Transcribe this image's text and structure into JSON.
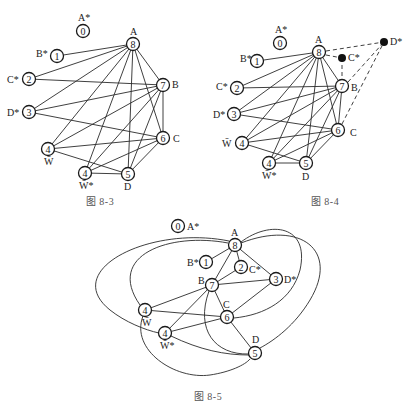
{
  "top_cutoff_text": "",
  "figures": [
    {
      "id": "fig-8-3",
      "caption": "图 8-3",
      "nodes": [
        {
          "key": "A*",
          "value": "0",
          "label": "A*",
          "x": 83,
          "y": 31
        },
        {
          "key": "B*",
          "value": "1",
          "label": "B*",
          "x": 57,
          "y": 56
        },
        {
          "key": "C*",
          "value": "2",
          "label": "C*",
          "x": 29,
          "y": 79
        },
        {
          "key": "D*",
          "value": "3",
          "label": "D*",
          "x": 29,
          "y": 112
        },
        {
          "key": "A",
          "value": "8",
          "label": "A",
          "x": 133,
          "y": 44
        },
        {
          "key": "B",
          "value": "7",
          "label": "B",
          "x": 163,
          "y": 85
        },
        {
          "key": "C",
          "value": "6",
          "label": "C",
          "x": 163,
          "y": 138
        },
        {
          "key": "W",
          "value": "4",
          "label": "W̄",
          "x": 48,
          "y": 149
        },
        {
          "key": "W*",
          "value": "4",
          "label": "W̄*",
          "x": 85,
          "y": 173
        },
        {
          "key": "D",
          "value": "5",
          "label": "D",
          "x": 128,
          "y": 174
        }
      ],
      "edges": [
        [
          "A",
          "B*"
        ],
        [
          "A",
          "C*"
        ],
        [
          "A",
          "D*"
        ],
        [
          "A",
          "W"
        ],
        [
          "A",
          "W*"
        ],
        [
          "A",
          "D"
        ],
        [
          "A",
          "C"
        ],
        [
          "A",
          "B"
        ],
        [
          "C*",
          "B"
        ],
        [
          "D*",
          "B"
        ],
        [
          "D*",
          "C"
        ],
        [
          "B",
          "W"
        ],
        [
          "B",
          "W*"
        ],
        [
          "B",
          "D"
        ],
        [
          "B",
          "C"
        ],
        [
          "C",
          "W"
        ],
        [
          "C",
          "W*"
        ],
        [
          "C",
          "D"
        ],
        [
          "W",
          "D"
        ],
        [
          "W*",
          "D"
        ]
      ]
    },
    {
      "id": "fig-8-4",
      "caption": "图 8-4",
      "nodes": [
        {
          "key": "A*",
          "value": "0",
          "label": "A*",
          "x": 280,
          "y": 43
        },
        {
          "key": "B*",
          "value": "1",
          "label": "B*",
          "x": 257,
          "y": 61
        },
        {
          "key": "C*",
          "value": "2",
          "label": "C*",
          "x": 237,
          "y": 88
        },
        {
          "key": "D*",
          "value": "3",
          "label": "D*",
          "x": 234,
          "y": 114
        },
        {
          "key": "A",
          "value": "8",
          "label": "A",
          "x": 319,
          "y": 52
        },
        {
          "key": "B",
          "value": "7",
          "label": "B",
          "x": 342,
          "y": 86
        },
        {
          "key": "C",
          "value": "6",
          "label": "C",
          "x": 338,
          "y": 130
        },
        {
          "key": "W",
          "value": "4",
          "label": "W̄",
          "x": 242,
          "y": 143
        },
        {
          "key": "W*",
          "value": "4",
          "label": "W̄*",
          "x": 269,
          "y": 163
        },
        {
          "key": "D",
          "value": "5",
          "label": "D",
          "x": 306,
          "y": 163
        }
      ],
      "extra_points": [
        {
          "key": "C*'",
          "label": "C*",
          "x": 342,
          "y": 58
        },
        {
          "key": "D*'",
          "label": "D*",
          "x": 384,
          "y": 42
        }
      ],
      "edges": [
        [
          "A",
          "B*"
        ],
        [
          "A",
          "C*"
        ],
        [
          "A",
          "D*"
        ],
        [
          "A",
          "W"
        ],
        [
          "A",
          "W*"
        ],
        [
          "A",
          "D"
        ],
        [
          "A",
          "C"
        ],
        [
          "A",
          "B"
        ],
        [
          "C*",
          "B"
        ],
        [
          "D*",
          "B"
        ],
        [
          "D*",
          "C"
        ],
        [
          "B",
          "W"
        ],
        [
          "B",
          "W*"
        ],
        [
          "B",
          "D"
        ],
        [
          "B",
          "C"
        ],
        [
          "C",
          "W"
        ],
        [
          "C",
          "W*"
        ],
        [
          "C",
          "D"
        ],
        [
          "W",
          "D"
        ],
        [
          "W*",
          "D"
        ]
      ],
      "dashed_edges": [
        [
          "A",
          "C*'"
        ],
        [
          "C*'",
          "B"
        ],
        [
          "A",
          "D*'"
        ],
        [
          "B",
          "D*'"
        ],
        [
          "C",
          "D*'"
        ]
      ]
    },
    {
      "id": "fig-8-5",
      "caption": "图 8-5",
      "nodes": [
        {
          "key": "A*",
          "value": "0",
          "label": "A*",
          "x": 178,
          "y": 226
        },
        {
          "key": "A",
          "value": "8",
          "label": "A",
          "x": 235,
          "y": 245
        },
        {
          "key": "B*",
          "value": "1",
          "label": "B*",
          "x": 206,
          "y": 262
        },
        {
          "key": "C*",
          "value": "2",
          "label": "C*",
          "x": 241,
          "y": 267
        },
        {
          "key": "B",
          "value": "7",
          "label": "B",
          "x": 212,
          "y": 285
        },
        {
          "key": "D*",
          "value": "3",
          "label": "D*",
          "x": 276,
          "y": 279
        },
        {
          "key": "C",
          "value": "6",
          "label": "C",
          "x": 227,
          "y": 317
        },
        {
          "key": "W",
          "value": "4",
          "label": "W̄",
          "x": 145,
          "y": 310
        },
        {
          "key": "W*",
          "value": "4",
          "label": "W̄*",
          "x": 165,
          "y": 333
        },
        {
          "key": "D",
          "value": "5",
          "label": "D",
          "x": 255,
          "y": 353
        }
      ]
    }
  ]
}
